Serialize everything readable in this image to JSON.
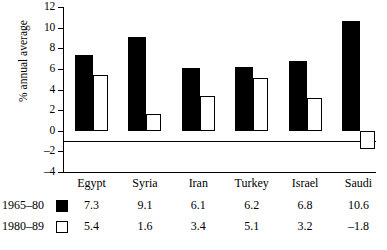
{
  "chart_data": {
    "type": "bar",
    "title": "",
    "xlabel": "",
    "ylabel": "% annual average",
    "ylim": [
      -4,
      12
    ],
    "yticks": [
      12,
      10,
      8,
      6,
      4,
      2,
      0,
      -2,
      -4
    ],
    "ytick_labels": [
      "12",
      "10",
      "8",
      "6",
      "4",
      "2",
      "0",
      "–2",
      "–4"
    ],
    "grid": false,
    "legend_position": "below-table-left",
    "categories": [
      "Egypt",
      "Syria",
      "Iran",
      "Turkey",
      "Israel",
      "Saudi"
    ],
    "series": [
      {
        "name": "1965–80",
        "style": "filled-black",
        "color": "#000000",
        "values": [
          7.3,
          9.1,
          6.1,
          6.2,
          6.8,
          10.6
        ],
        "value_labels": [
          "7.3",
          "9.1",
          "6.1",
          "6.2",
          "6.8",
          "10.6"
        ]
      },
      {
        "name": "1980–89",
        "style": "open-white",
        "color": "#ffffff",
        "values": [
          5.4,
          1.6,
          3.4,
          5.1,
          3.2,
          -1.8
        ],
        "value_labels": [
          "5.4",
          "1.6",
          "3.4",
          "5.1",
          "3.2",
          "–1.8"
        ]
      }
    ]
  },
  "table": {
    "header_row": [
      "Egypt",
      "Syria",
      "Iran",
      "Turkey",
      "Israel",
      "Saudi"
    ],
    "rows": [
      {
        "label": "1965–80",
        "swatch": "black-square-swatch",
        "values": [
          "7.3",
          "9.1",
          "6.1",
          "6.2",
          "6.8",
          "10.6"
        ]
      },
      {
        "label": "1980–89",
        "swatch": "white-square-swatch",
        "values": [
          "5.4",
          "1.6",
          "3.4",
          "5.1",
          "3.2",
          "–1.8"
        ]
      }
    ]
  }
}
